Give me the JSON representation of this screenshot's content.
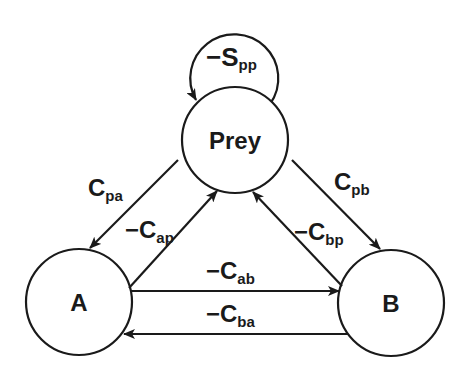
{
  "diagram": {
    "type": "food-web interaction diagram",
    "nodes": [
      {
        "id": "prey",
        "label": "Prey",
        "cx": 235,
        "cy": 140,
        "r": 53
      },
      {
        "id": "a",
        "label": "A",
        "cx": 79,
        "cy": 302,
        "r": 53
      },
      {
        "id": "b",
        "label": "B",
        "cx": 391,
        "cy": 303,
        "r": 53
      }
    ],
    "edges": [
      {
        "id": "spp",
        "from": "prey",
        "to": "prey",
        "sign": "−",
        "main": "S",
        "sub": "pp"
      },
      {
        "id": "cpa",
        "from": "prey",
        "to": "a",
        "sign": "",
        "main": "C",
        "sub": "pa"
      },
      {
        "id": "cap",
        "from": "a",
        "to": "prey",
        "sign": "−",
        "main": "C",
        "sub": "ap"
      },
      {
        "id": "cpb",
        "from": "prey",
        "to": "b",
        "sign": "",
        "main": "C",
        "sub": "pb"
      },
      {
        "id": "cbp",
        "from": "b",
        "to": "prey",
        "sign": "−",
        "main": "C",
        "sub": "bp"
      },
      {
        "id": "cab",
        "from": "a",
        "to": "b",
        "sign": "−",
        "main": "C",
        "sub": "ab"
      },
      {
        "id": "cba",
        "from": "b",
        "to": "a",
        "sign": "−",
        "main": "C",
        "sub": "ba"
      }
    ]
  }
}
